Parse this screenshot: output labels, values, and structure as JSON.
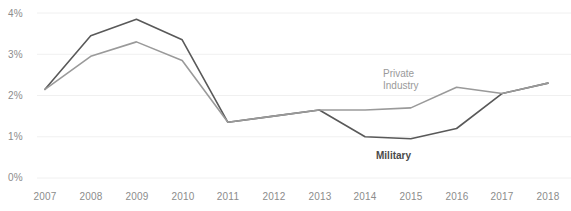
{
  "chart_data": {
    "type": "line",
    "title": "",
    "subtitle": "",
    "xlabel": "",
    "ylabel": "",
    "x": [
      2007,
      2008,
      2009,
      2010,
      2011,
      2012,
      2013,
      2014,
      2015,
      2016,
      2017,
      2018
    ],
    "categories": [
      "2007",
      "2008",
      "2009",
      "2010",
      "2011",
      "2012",
      "2013",
      "2014",
      "2015",
      "2016",
      "2017",
      "2018"
    ],
    "series": [
      {
        "name": "Military",
        "color": "#595959",
        "values": [
          2.15,
          3.45,
          3.85,
          3.35,
          1.35,
          1.5,
          1.65,
          1.0,
          0.95,
          1.2,
          2.05,
          2.3
        ]
      },
      {
        "name": "Private Industry",
        "color": "#9a9a9a",
        "values": [
          2.15,
          2.95,
          3.3,
          2.85,
          1.35,
          1.5,
          1.65,
          1.65,
          1.7,
          2.2,
          2.05,
          2.3
        ]
      }
    ],
    "ylim": [
      0,
      4
    ],
    "yticks": [
      0,
      1,
      2,
      3,
      4
    ],
    "ytick_labels": [
      "0%",
      "1%",
      "2%",
      "3%",
      "4%"
    ],
    "xlim": [
      2007,
      2018
    ],
    "grid": true,
    "grid_axis": "y",
    "grid_color": "#f0f0f0",
    "legend_position": "inline-annotations",
    "annotations": [
      {
        "name": "private-industry",
        "text_line_1": "Private",
        "text_line_2": "Industry",
        "x_px": 383,
        "y_px": 68
      },
      {
        "name": "military",
        "text_line_1": "Military",
        "x_px": 376,
        "y_px": 150
      }
    ]
  },
  "axis": {
    "y_tick_labels": [
      {
        "label": "4%",
        "y_px": 8
      },
      {
        "label": "3%",
        "y_px": 49
      },
      {
        "label": "2%",
        "y_px": 90
      },
      {
        "label": "1%",
        "y_px": 131
      },
      {
        "label": "0%",
        "y_px": 172
      }
    ],
    "x_tick_labels": [
      {
        "label": "2007",
        "x_px": 45
      },
      {
        "label": "2008",
        "x_px": 91
      },
      {
        "label": "2009",
        "x_px": 137
      },
      {
        "label": "2010",
        "x_px": 183
      },
      {
        "label": "2011",
        "x_px": 228
      },
      {
        "label": "2012",
        "x_px": 274
      },
      {
        "label": "2013",
        "x_px": 320
      },
      {
        "label": "2014",
        "x_px": 365
      },
      {
        "label": "2015",
        "x_px": 411
      },
      {
        "label": "2016",
        "x_px": 457
      },
      {
        "label": "2017",
        "x_px": 502
      },
      {
        "label": "2018",
        "x_px": 548
      }
    ],
    "x_label_y_px": 191
  }
}
